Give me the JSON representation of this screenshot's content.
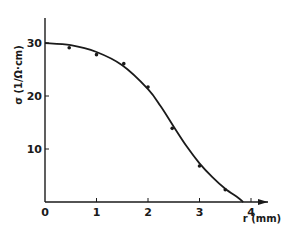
{
  "chart_data": {
    "type": "scatter",
    "title": "",
    "xlabel": "r (mm)",
    "ylabel": "σ (1/Ω·cm)",
    "xlim": [
      0,
      4.5
    ],
    "ylim": [
      0,
      35
    ],
    "xticks": [
      0,
      1,
      2,
      3,
      4
    ],
    "yticks": [
      10,
      20,
      30
    ],
    "grid": false,
    "legend": null,
    "series": [
      {
        "name": "measured",
        "kind": "points",
        "x": [
          0.47,
          1.0,
          1.53,
          2.0,
          2.47,
          3.0,
          3.5
        ],
        "y": [
          29.1,
          27.8,
          26.1,
          21.7,
          13.9,
          6.8,
          2.3
        ]
      },
      {
        "name": "fit",
        "kind": "line",
        "x": [
          0,
          0.5,
          1.0,
          1.5,
          2.0,
          2.25,
          2.5,
          2.75,
          3.0,
          3.25,
          3.5,
          3.75,
          3.85
        ],
        "y": [
          30,
          29.6,
          28.3,
          25.8,
          21.3,
          18.0,
          14.2,
          10.5,
          7.3,
          4.7,
          2.5,
          0.8,
          0
        ]
      }
    ]
  },
  "axes": {
    "x_title": "r (mm)",
    "y_title": "σ (1/Ω·cm)",
    "x_tick_labels": [
      "0",
      "1",
      "2",
      "3",
      "4"
    ],
    "y_tick_labels": [
      "10",
      "20",
      "30"
    ]
  },
  "colors": {
    "ink": "#1a1a1a",
    "background": "#ffffff"
  }
}
